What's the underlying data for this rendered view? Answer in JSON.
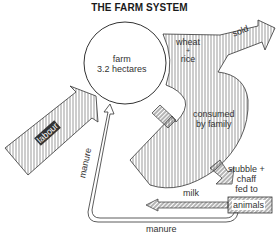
{
  "title": "THE FARM SYSTEM",
  "farm": {
    "line1": "farm",
    "line2": "3.2 hectares"
  },
  "flows": {
    "crop_line1": "wheat",
    "crop_plus": "+",
    "crop_line2": "rice",
    "sold": "sold",
    "consumed_line1": "consumed",
    "consumed_line2": "by family",
    "fodder_line1": "stubble +",
    "fodder_line2": "chaff",
    "fodder_line3": "fed to",
    "animals": "animals",
    "milk": "milk",
    "manure_bottom": "manure",
    "manure_side": "manure",
    "labour": "labour"
  },
  "colors": {
    "stroke": "#333333",
    "background": "#ffffff"
  }
}
